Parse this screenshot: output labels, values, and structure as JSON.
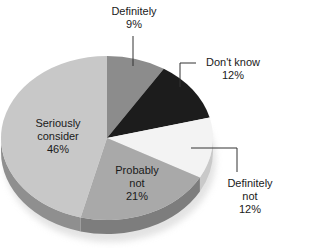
{
  "chart_data": {
    "type": "pie",
    "title": "",
    "style": "3d-pie",
    "start_angle_deg": 0,
    "direction": "clockwise",
    "slices": [
      {
        "label": "Definitely",
        "value": 9,
        "value_label": "9%",
        "color": "#8c8c8c",
        "side_color": "#6e6e6e"
      },
      {
        "label": "Don't know",
        "value": 12,
        "value_label": "12%",
        "color": "#1c1c1c",
        "side_color": "#101010"
      },
      {
        "label": "Definitely not",
        "value": 12,
        "value_label": "12%",
        "color": "#f3f3f3",
        "side_color": "#c9c9c9"
      },
      {
        "label": "Probably not",
        "value": 21,
        "value_label": "21%",
        "color": "#a9a9a9",
        "side_color": "#7d7d7d"
      },
      {
        "label": "Seriously consider",
        "value": 46,
        "value_label": "46%",
        "color": "#c8c8c8",
        "side_color": "#8f8f8f"
      }
    ],
    "labels": {
      "definitely": {
        "line1": "Definitely",
        "line2": "9%"
      },
      "dont_know": {
        "line1": "Don't know",
        "line2": "12%"
      },
      "definitely_not": {
        "line1": "Definitely",
        "line2": "not",
        "line3": "12%"
      },
      "probably_not": {
        "line1": "Probably",
        "line2": "not",
        "line3": "21%"
      },
      "seriously_consider": {
        "line1": "Seriously",
        "line2": "consider",
        "line3": "46%"
      }
    },
    "legend": "none (labels on/near slices with leader lines)"
  }
}
